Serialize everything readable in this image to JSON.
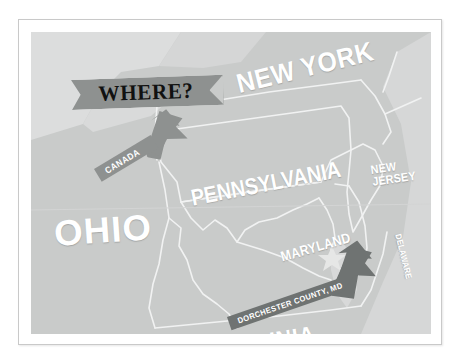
{
  "title": "WHERE?",
  "banner": {
    "label": "WHERE?",
    "fill_color": "#8e9190",
    "text_color": "#111111"
  },
  "map": {
    "background_color": "#c9cbca",
    "land_color": "#c9cbca",
    "water_color": "#dedfdf",
    "border_color": "#f2f2f2",
    "label_color": "#ffffff",
    "state_labels": [
      {
        "name": "ohio-label",
        "text": "OHIO"
      },
      {
        "name": "new-york-label",
        "text": "NEW YORK"
      },
      {
        "name": "pennsylvania-label",
        "text": "PENNSYLVANIA"
      },
      {
        "name": "virginia-label",
        "text": "VIRGINIA"
      },
      {
        "name": "maryland-label",
        "text": "MARYLAND"
      },
      {
        "name": "new-jersey-label",
        "text": "NEW JERSEY",
        "line1": "NEW",
        "line2": "JERSEY"
      },
      {
        "name": "delaware-label",
        "text": "DELAWARE"
      },
      {
        "name": "connecticut-label",
        "text": "CONNECTICUT"
      }
    ],
    "callouts": [
      {
        "name": "canada-arrow",
        "text": "CANADA",
        "fill_color": "#8e9190",
        "text_color": "#ffffff",
        "points_to": "up-right"
      },
      {
        "name": "dorchester-county-arrow",
        "text": "DORCHESTER COUNTY, MD",
        "fill_color": "#6f7372",
        "text_color": "#ffffff",
        "points_to": "up-right"
      }
    ],
    "marker": {
      "name": "location-star-marker",
      "shape": "star",
      "color": "#e4e5e4"
    }
  },
  "frame": {
    "border_color": "#c9c9c9",
    "mat_color": "#ffffff"
  }
}
